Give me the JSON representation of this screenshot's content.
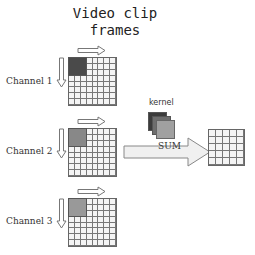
{
  "title": {
    "line1": "Video clip",
    "line2": "frames"
  },
  "channels": [
    {
      "label": "Channel 1",
      "shade_color": "#4a4a4a",
      "top": 57
    },
    {
      "label": "Channel 2",
      "shade_color": "#888888",
      "top": 128
    },
    {
      "label": "Channel 3",
      "shade_color": "#999999",
      "top": 198
    }
  ],
  "input_grid": {
    "rows": 8,
    "cols": 8,
    "kernel_cells": 3,
    "cell_px": 6
  },
  "kernel": {
    "label": "kernel",
    "layer_colors": [
      "#3c3c3c",
      "#6e6e6e",
      "#a0a0a0"
    ]
  },
  "sum_arrow": {
    "label": "SUM"
  },
  "output_grid": {
    "rows": 5,
    "cols": 5
  },
  "colors": {
    "grid_line": "#777777",
    "cell_fill": "#f4f4f4",
    "arrow_stroke": "#777777",
    "arrow_fill": "#f0f0f0"
  }
}
